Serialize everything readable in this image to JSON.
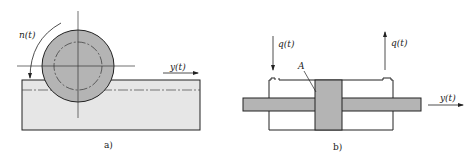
{
  "figure_a": {
    "caption": "a)",
    "labels": {
      "rotation": "n(t)",
      "displacement": "y(t)"
    },
    "colors": {
      "roller_fill": "#b4b4b4",
      "base_fill": "#e6e6e6",
      "stroke": "#222222"
    }
  },
  "figure_b": {
    "caption": "b)",
    "labels": {
      "flow_in": "q(t)",
      "flow_out": "q(t)",
      "area": "A",
      "displacement": "y(t)"
    },
    "colors": {
      "rod_fill": "#b4b4b4",
      "piston_fill": "#b4b4b4",
      "stroke": "#222222"
    }
  }
}
